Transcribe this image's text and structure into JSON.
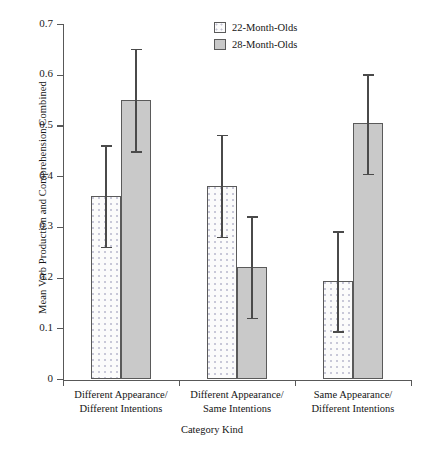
{
  "chart_data": {
    "type": "bar",
    "title": "",
    "xlabel": "Category Kind",
    "ylabel": "Mean Verb Production and Comprehension Combined",
    "ylim": [
      0,
      0.7
    ],
    "ytick_labels": [
      "0.7",
      "0.6",
      "0.5",
      "0.4",
      "0.3",
      "0.2",
      "0.1",
      "0"
    ],
    "ytick_values": [
      0.7,
      0.6,
      0.5,
      0.4,
      0.3,
      0.2,
      0.1,
      0
    ],
    "grid": false,
    "legend_position": "top-center-right",
    "categories": [
      "Different Appearance/ Different Intentions",
      "Different Appearance/ Same Intentions",
      "Same Appearance/ Different Intentions"
    ],
    "category_lines": [
      [
        "Different Appearance/",
        "Different Intentions"
      ],
      [
        "Different Appearance/",
        "Same Intentions"
      ],
      [
        "Same Appearance/",
        "Different Intentions"
      ]
    ],
    "series": [
      {
        "name": "22-Month-Olds",
        "fill": "dotted",
        "values": [
          0.362,
          0.382,
          0.195
        ],
        "error_low": [
          0.262,
          0.282,
          0.095
        ],
        "error_high": [
          0.462,
          0.482,
          0.292
        ]
      },
      {
        "name": "28-Month-Olds",
        "fill": "gray",
        "values": [
          0.552,
          0.222,
          0.505
        ],
        "error_low": [
          0.45,
          0.122,
          0.405
        ],
        "error_high": [
          0.652,
          0.322,
          0.602
        ]
      }
    ]
  },
  "legend": {
    "items": [
      {
        "label": "22-Month-Olds",
        "swatch": "dotted-swatch"
      },
      {
        "label": "28-Month-Olds",
        "swatch": "gray-swatch"
      }
    ]
  },
  "axes": {
    "y_title": "Mean Verb Production and Comprehension Combined",
    "x_title": "Category Kind",
    "y_ticks": [
      "0.7",
      "0.6",
      "0.5",
      "0.4",
      "0.3",
      "0.2",
      "0.1",
      "0"
    ]
  }
}
